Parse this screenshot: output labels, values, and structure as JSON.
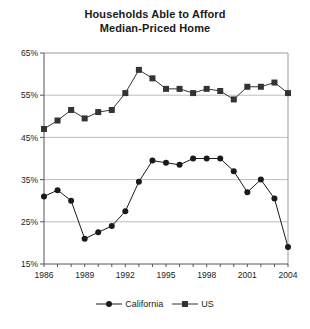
{
  "chart_data": {
    "type": "line",
    "title": "Households Able to Afford Median-Priced Home",
    "title_lines": [
      "Households Able to Afford",
      "Median-Priced Home"
    ],
    "xlabel": "",
    "ylabel": "",
    "x": [
      1986,
      1987,
      1988,
      1989,
      1990,
      1991,
      1992,
      1993,
      1994,
      1995,
      1996,
      1997,
      1998,
      1999,
      2000,
      2001,
      2002,
      2003,
      2004
    ],
    "xtick_labels": [
      "1986",
      "1989",
      "1992",
      "1995",
      "1998",
      "2001",
      "2004"
    ],
    "xtick_values": [
      1986,
      1989,
      1992,
      1995,
      1998,
      2001,
      2004
    ],
    "ytick_labels": [
      "15%",
      "25%",
      "35%",
      "45%",
      "55%",
      "65%"
    ],
    "ytick_values": [
      15,
      25,
      35,
      45,
      55,
      65
    ],
    "ylim": [
      15,
      65
    ],
    "xlim": [
      1986,
      2004
    ],
    "grid": "horizontal",
    "legend_position": "bottom",
    "series": [
      {
        "name": "California",
        "marker": "circle",
        "color": "#1a1a1a",
        "values": [
          31.0,
          32.5,
          30.0,
          21.0,
          22.5,
          24.0,
          27.5,
          34.5,
          39.5,
          39.0,
          38.5,
          40.0,
          40.0,
          40.0,
          37.0,
          32.0,
          35.0,
          30.5,
          19.0
        ]
      },
      {
        "name": "US",
        "marker": "square",
        "color": "#333333",
        "values": [
          47.0,
          49.0,
          51.5,
          49.5,
          51.0,
          51.5,
          55.5,
          61.0,
          59.0,
          56.5,
          56.5,
          55.5,
          56.5,
          56.0,
          54.0,
          57.0,
          57.0,
          58.0,
          55.5
        ]
      }
    ]
  },
  "legend": {
    "items": [
      {
        "label": "California",
        "marker": "circle"
      },
      {
        "label": "US",
        "marker": "square"
      }
    ]
  }
}
